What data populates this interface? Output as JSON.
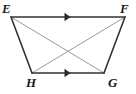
{
  "figure": {
    "name": "trapezoid-EFGH",
    "type": "geometry-diagram",
    "shape": "isosceles trapezoid with both diagonals drawn",
    "background_color": "#ffffff",
    "perimeter_color": "#333333",
    "diagonal_color": "#9a9a9a",
    "label_color": "#1a1a1a",
    "perimeter_stroke_width": 1.6,
    "diagonal_stroke_width": 1.0
  },
  "vertices": [
    {
      "id": "E",
      "label": "E",
      "x": 11,
      "y": 17,
      "label_position": "top-left"
    },
    {
      "id": "F",
      "label": "F",
      "x": 125,
      "y": 17,
      "label_position": "top-right"
    },
    {
      "id": "G",
      "label": "G",
      "x": 104,
      "y": 73,
      "label_position": "bottom-right"
    },
    {
      "id": "H",
      "label": "H",
      "x": 32,
      "y": 73,
      "label_position": "bottom-left"
    }
  ],
  "edges": [
    {
      "id": "EF",
      "from": "E",
      "to": "F",
      "role": "parallel-side",
      "color": "#333333",
      "tick_marks": 1,
      "marker": "single-right-arrow"
    },
    {
      "id": "FG",
      "from": "F",
      "to": "G",
      "role": "leg",
      "color": "#333333",
      "tick_marks": 0,
      "marker": "none"
    },
    {
      "id": "HG",
      "from": "H",
      "to": "G",
      "role": "parallel-side",
      "color": "#333333",
      "tick_marks": 1,
      "marker": "single-right-arrow"
    },
    {
      "id": "EH",
      "from": "E",
      "to": "H",
      "role": "leg",
      "color": "#333333",
      "tick_marks": 0,
      "marker": "none"
    }
  ],
  "diagonals": [
    {
      "id": "EG",
      "from": "E",
      "to": "G",
      "color": "#9a9a9a"
    },
    {
      "id": "FH",
      "from": "F",
      "to": "H",
      "color": "#9a9a9a"
    }
  ],
  "intersection": {
    "id": "diagonal-crossing",
    "x": 68,
    "y": 47
  },
  "markers": [
    {
      "id": "arrow-EF",
      "on_edge": "EF",
      "x": 68,
      "y": 17,
      "direction": "right",
      "count": 1
    },
    {
      "id": "arrow-HG",
      "on_edge": "HG",
      "x": 68,
      "y": 73,
      "direction": "right",
      "count": 1
    }
  ]
}
